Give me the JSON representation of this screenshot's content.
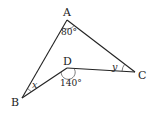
{
  "diagram": {
    "type": "geometry-figure",
    "vertices": {
      "A": {
        "label": "A",
        "x": 67,
        "y": 20
      },
      "B": {
        "label": "B",
        "x": 22,
        "y": 98
      },
      "C": {
        "label": "C",
        "x": 135,
        "y": 72
      },
      "D": {
        "label": "D",
        "x": 67,
        "y": 68
      }
    },
    "segments": [
      [
        "A",
        "B"
      ],
      [
        "A",
        "C"
      ],
      [
        "B",
        "D"
      ],
      [
        "D",
        "C"
      ]
    ],
    "angles": {
      "A": {
        "label": "80°",
        "value": 80
      },
      "D": {
        "label": "140°",
        "value": 140
      },
      "B": {
        "label": "x",
        "variable": true
      },
      "C": {
        "label": "y",
        "variable": true
      }
    },
    "colors": {
      "stroke": "#222222",
      "background": "#ffffff"
    }
  }
}
